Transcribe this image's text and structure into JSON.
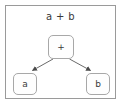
{
  "diagram": {
    "title": "a + b",
    "type": "expression-tree",
    "frame": {
      "border_color": "#9a9a9a",
      "background": "#ffffff"
    },
    "nodes": [
      {
        "id": "root",
        "label": "+",
        "role": "operator",
        "x": 61,
        "y": 47
      },
      {
        "id": "left",
        "label": "a",
        "role": "operand",
        "x": 25,
        "y": 84
      },
      {
        "id": "right",
        "label": "b",
        "role": "operand",
        "x": 98,
        "y": 84
      }
    ],
    "edges": [
      {
        "from": "root",
        "to": "left",
        "arrow": "filled-triangle"
      },
      {
        "from": "root",
        "to": "right",
        "arrow": "filled-triangle"
      }
    ],
    "colors": {
      "node_border": "#a8a8a8",
      "node_fill": "#fefefe",
      "text": "#3a3a3a",
      "edge": "#555555"
    }
  }
}
